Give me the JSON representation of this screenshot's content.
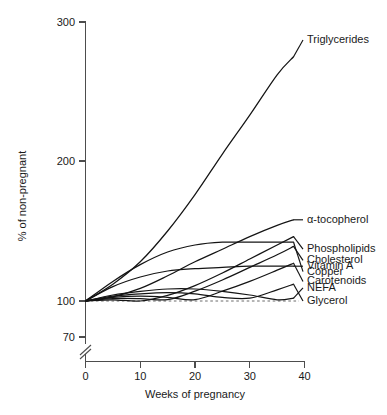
{
  "chart_data": {
    "type": "line",
    "title": "",
    "xlabel": "Weeks of pregnancy",
    "ylabel": "% of non-pregnant",
    "xlim": [
      0,
      40
    ],
    "ylim": [
      70,
      300
    ],
    "grid": false,
    "legend_position": "right-inline-labels",
    "axis_break": {
      "present": true,
      "axis": "y",
      "below_value": 70
    },
    "xticks": [
      0,
      10,
      20,
      30,
      40
    ],
    "xtick_labels": [
      "0",
      "10",
      "20",
      "30",
      "40"
    ],
    "yticks": [
      70,
      100,
      200,
      300
    ],
    "ytick_labels": [
      "70",
      "100",
      "200",
      "300"
    ],
    "annotations": [
      {
        "name": "reference-line",
        "type": "dashed-horizontal",
        "value": 100,
        "x_from": 0,
        "x_to": 39
      }
    ],
    "x": [
      0,
      5,
      10,
      15,
      20,
      25,
      30,
      35,
      38
    ],
    "series": [
      {
        "name": "Triglycerides",
        "label": "Triglycerides",
        "values": [
          100,
          112,
          128,
          150,
          176,
          205,
          233,
          262,
          275
        ],
        "label_x": 40.5,
        "label_value": 287
      },
      {
        "name": "alpha-tocopherol",
        "label": "α-tocopherol",
        "values": [
          100,
          103,
          109,
          118,
          128,
          137,
          146,
          154,
          158
        ],
        "label_x": 40.5,
        "label_value": 158
      },
      {
        "name": "Phospholipids",
        "label": "Phospholipids",
        "values": [
          100,
          99,
          100,
          104,
          111,
          120,
          130,
          140,
          146
        ],
        "label_x": 40.5,
        "label_value": 137
      },
      {
        "name": "Cholesterol",
        "label": "Cholesterol",
        "values": [
          100,
          98,
          98,
          101,
          107,
          115,
          124,
          133,
          139
        ],
        "label_x": 40.5,
        "label_value": 129
      },
      {
        "name": "Copper",
        "label": "Copper",
        "values": [
          100,
          114,
          126,
          135,
          140,
          142,
          142,
          142,
          142
        ],
        "label_x": 40.5,
        "label_value": 121
      },
      {
        "name": "Carotenoids",
        "label": "Carotenoids",
        "values": [
          100,
          97,
          96,
          97,
          101,
          107,
          114,
          122,
          127
        ],
        "label_x": 40.5,
        "label_value": 114
      },
      {
        "name": "Glycerol",
        "label": "Glycerol",
        "values": [
          100,
          96,
          94,
          93,
          94,
          97,
          102,
          108,
          112
        ],
        "label_x": 40.5,
        "label_value": 100
      },
      {
        "name": "NEFA",
        "label": "NEFA",
        "values": [
          100,
          95,
          92,
          90,
          90,
          92,
          95,
          99,
          102
        ],
        "label_x": 40.5,
        "label_value": 89
      },
      {
        "name": "Vitamin A",
        "label": "Vitamin A",
        "values": [
          100,
          88,
          80,
          75,
          73,
          72,
          71,
          71,
          71
        ],
        "label_x": 40.5,
        "label_value": 71
      }
    ]
  }
}
